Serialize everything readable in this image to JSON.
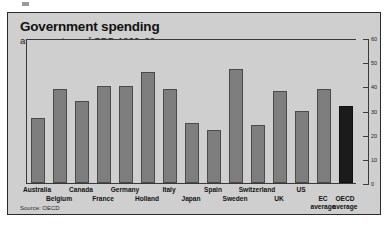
{
  "header": {
    "title": "Government spending",
    "subtitle": "as percentage of GDP, 1960–90",
    "source": "Source: OECD"
  },
  "colors": {
    "panel_background": "#cfcfcf",
    "bar": "#7e7e7e",
    "bar_highlight": "#1b1b1b",
    "axis": "#3a3a3a",
    "text": "#121212"
  },
  "chart_data": {
    "type": "bar",
    "title": "Government spending",
    "subtitle": "as percentage of GDP, 1960–90",
    "xlabel": "",
    "ylabel": "",
    "ylim": [
      0,
      60
    ],
    "yticks": [
      0,
      10,
      20,
      30,
      40,
      50,
      60
    ],
    "ytick_labels": [
      "0",
      "10",
      "20",
      "30",
      "40",
      "50",
      "60"
    ],
    "grid": false,
    "legend": null,
    "source": "Source: OECD",
    "highlight_category": "OECD average",
    "categories": [
      "Australia",
      "Belgium",
      "Canada",
      "France",
      "Germany",
      "Holland",
      "Italy",
      "Japan",
      "Spain",
      "Sweden",
      "Switzerland",
      "UK",
      "US",
      "EC average",
      "OECD average"
    ],
    "values": [
      27,
      39,
      34,
      40,
      40,
      46,
      39,
      25,
      22,
      47,
      24,
      38,
      30,
      39,
      32
    ],
    "label_rows": [
      0,
      1,
      0,
      1,
      0,
      1,
      0,
      1,
      0,
      1,
      0,
      1,
      0,
      1,
      0
    ],
    "label_lines": [
      [
        "Australia"
      ],
      [
        "Belgium"
      ],
      [
        "Canada"
      ],
      [
        "France"
      ],
      [
        "Germany"
      ],
      [
        "Holland"
      ],
      [
        "Italy"
      ],
      [
        "Japan"
      ],
      [
        "Spain"
      ],
      [
        "Sweden"
      ],
      [
        "Switzerland"
      ],
      [
        "UK"
      ],
      [
        "US"
      ],
      [
        "EC",
        "average"
      ],
      [
        "OECD",
        "average"
      ]
    ]
  }
}
